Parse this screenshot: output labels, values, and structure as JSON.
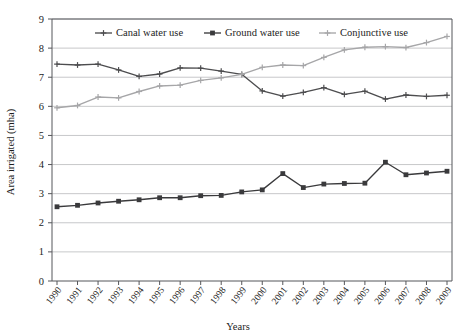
{
  "chart_data": {
    "type": "line",
    "title": "",
    "xlabel": "Years",
    "ylabel": "Area irrigated (mha)",
    "categories": [
      "1990",
      "1991",
      "1992",
      "1993",
      "1994",
      "1995",
      "1996",
      "1997",
      "1998",
      "1999",
      "2000",
      "2001",
      "2002",
      "2003",
      "2004",
      "2005",
      "2006",
      "2007",
      "2008",
      "2009"
    ],
    "xlim": [
      1990,
      2009
    ],
    "ylim": [
      0,
      9
    ],
    "y_ticks": [
      0,
      1,
      2,
      3,
      4,
      5,
      6,
      7,
      8,
      9
    ],
    "grid": "horizontal",
    "legend_position": "top-inside",
    "series": [
      {
        "name": "Canal water use",
        "color": "#4d4d4f",
        "marker": "plus",
        "values": [
          7.45,
          7.42,
          7.45,
          7.25,
          7.03,
          7.11,
          7.32,
          7.31,
          7.21,
          7.1,
          6.53,
          6.35,
          6.48,
          6.64,
          6.41,
          6.52,
          6.25,
          6.39,
          6.34,
          6.38
        ]
      },
      {
        "name": "Ground water use",
        "color": "#3a3a3c",
        "marker": "square",
        "values": [
          2.55,
          2.6,
          2.68,
          2.74,
          2.79,
          2.86,
          2.86,
          2.93,
          2.94,
          3.06,
          3.13,
          3.69,
          3.21,
          3.33,
          3.35,
          3.36,
          4.08,
          3.65,
          3.71,
          3.77
        ]
      },
      {
        "name": "Conjunctive use",
        "color": "#a6a6a8",
        "marker": "plus",
        "values": [
          5.95,
          6.03,
          6.32,
          6.29,
          6.51,
          6.7,
          6.73,
          6.89,
          6.98,
          7.1,
          7.34,
          7.42,
          7.4,
          7.68,
          7.94,
          8.03,
          8.05,
          8.02,
          8.19,
          8.4
        ]
      }
    ]
  },
  "legend": {
    "items": [
      {
        "label": "Canal water use"
      },
      {
        "label": "Ground water use"
      },
      {
        "label": "Conjunctive use"
      }
    ]
  }
}
